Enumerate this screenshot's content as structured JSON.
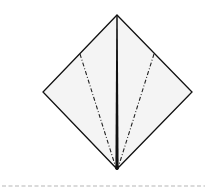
{
  "diagram": {
    "type": "origami-fold-diagram",
    "paper_fill": "#f4f4f4",
    "edge_color": "#111111",
    "separator_color": "#b5b5b5",
    "shape": {
      "name": "square-diamond",
      "points": {
        "top": [
          117,
          15
        ],
        "right": [
          192,
          92
        ],
        "bottom": [
          117,
          169
        ],
        "left": [
          43,
          92
        ]
      }
    },
    "center_crease": {
      "from": [
        117,
        15
      ],
      "to": [
        117,
        169
      ],
      "style": "solid-thick"
    },
    "valley_folds": [
      {
        "name": "left-fold",
        "from": [
          80,
          54
        ],
        "to": [
          116,
          168
        ],
        "style": "dash-dot"
      },
      {
        "name": "right-fold",
        "from": [
          154,
          54
        ],
        "to": [
          118,
          168
        ],
        "style": "dash-dot"
      }
    ],
    "separator": {
      "y": 186,
      "x1": 2,
      "x2": 205,
      "style": "dashed"
    }
  }
}
